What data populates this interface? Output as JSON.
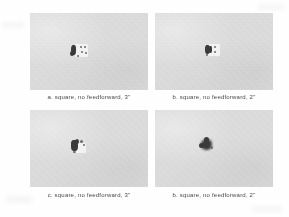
{
  "figure": {
    "name": "four-panel-imaging-figure",
    "background_color": "#ffffff",
    "panel_field_color": "#d9d9d9",
    "caption_color": "#4a4a4a",
    "blob_color": "#3a3a3a",
    "panels": [
      {
        "id": "panel-a",
        "caption": "a. square, no feedforward, 3ʺ",
        "label": "a.",
        "shape": "square",
        "control": "no feedforward",
        "aperture": "3ʺ"
      },
      {
        "id": "panel-b",
        "caption": "b. square, no feedforward, 2ʺ",
        "label": "b.",
        "shape": "square",
        "control": "no feedforward",
        "aperture": "2ʺ"
      },
      {
        "id": "panel-c",
        "caption": "c. square, no feedforward, 3ʺ",
        "label": "c.",
        "shape": "square",
        "control": "no feedforward",
        "aperture": "3ʺ"
      },
      {
        "id": "panel-d",
        "caption": "b. square, no feedforward, 2ʺ",
        "label": "b.",
        "shape": "square",
        "control": "no feedforward",
        "aperture": "2ʺ"
      }
    ]
  }
}
